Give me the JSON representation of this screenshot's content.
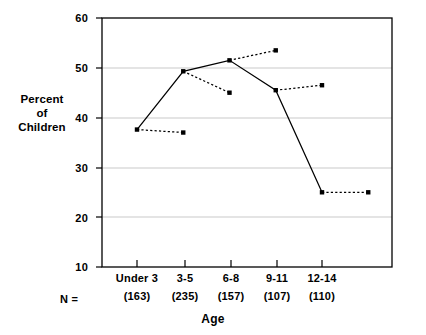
{
  "chart_data": {
    "type": "line",
    "title": "",
    "xlabel": "Age",
    "ylabel": "Percent of Children",
    "ylabel_lines": [
      "Percent",
      "of",
      "Children"
    ],
    "categories": [
      "Under 3",
      "3-5",
      "6-8",
      "9-11",
      "12-14"
    ],
    "n_label": "N =",
    "n_values": [
      "(163)",
      "(235)",
      "(157)",
      "(107)",
      "(110)"
    ],
    "ylim": [
      10,
      60
    ],
    "yticks": [
      10,
      20,
      30,
      40,
      50,
      60
    ],
    "ytick_labels": [
      "10",
      "20",
      "30",
      "40",
      "50",
      "60"
    ],
    "grid": true,
    "grid_y": [
      20,
      30,
      40,
      50
    ],
    "legend_position": "none",
    "series": [
      {
        "name": "solid-series",
        "style": "solid",
        "marker": "square",
        "color": "#000000",
        "values": [
          37.6,
          49.3,
          51.5,
          45.5,
          25.0
        ]
      },
      {
        "name": "dashed-series",
        "style": "dashed",
        "marker": "square",
        "color": "#000000",
        "segments": [
          {
            "from_index": 0,
            "from_value": 37.6,
            "to_index": 1,
            "to_value": 37.0
          },
          {
            "from_index": 1,
            "from_value": 49.3,
            "to_index": 2,
            "to_value": 45.0
          },
          {
            "from_index": 2,
            "from_value": 51.5,
            "to_index": 3,
            "to_value": 53.5
          },
          {
            "from_index": 3,
            "from_value": 45.5,
            "to_index": 4,
            "to_value": 46.5
          },
          {
            "from_index": 4,
            "from_value": 25.0,
            "to_index": 5,
            "to_value": 25.0
          }
        ]
      }
    ]
  }
}
